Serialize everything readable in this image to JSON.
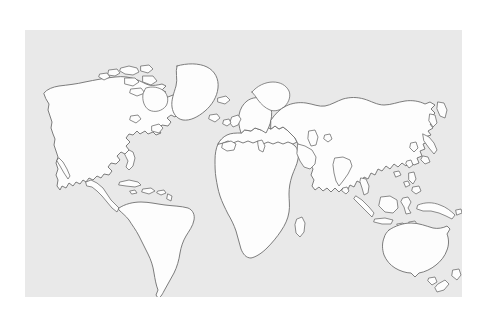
{
  "image": {
    "title": "World Map Outline",
    "kind": "map",
    "projection": "equirectangular-simplified",
    "style": "line-art outline, no labels",
    "caption": ""
  },
  "canvas": {
    "width": 489,
    "height": 314,
    "margin_color": "#ffffff"
  },
  "panel": {
    "left": 25,
    "top": 30,
    "width": 437,
    "height": 267,
    "background_color": "#e9e9e9"
  },
  "palette": {
    "ocean": "#e9e9e9",
    "land_fill": "#fdfdfd",
    "coastline_stroke": "#6e6e6e",
    "page_background": "#ffffff"
  },
  "landmasses": [
    {
      "name": "north-america",
      "label": "North America"
    },
    {
      "name": "greenland",
      "label": "Greenland"
    },
    {
      "name": "central-america",
      "label": "Central America"
    },
    {
      "name": "caribbean-islands",
      "label": "Caribbean Islands"
    },
    {
      "name": "south-america",
      "label": "South America"
    },
    {
      "name": "africa",
      "label": "Africa"
    },
    {
      "name": "europe",
      "label": "Europe"
    },
    {
      "name": "asia",
      "label": "Asia"
    },
    {
      "name": "british-isles",
      "label": "British Isles"
    },
    {
      "name": "scandinavia",
      "label": "Scandinavia"
    },
    {
      "name": "iceland",
      "label": "Iceland"
    },
    {
      "name": "japan",
      "label": "Japan"
    },
    {
      "name": "madagascar",
      "label": "Madagascar"
    },
    {
      "name": "sri-lanka",
      "label": "Sri Lanka"
    },
    {
      "name": "indonesia",
      "label": "Indonesia"
    },
    {
      "name": "philippines",
      "label": "Philippines"
    },
    {
      "name": "new-guinea",
      "label": "New Guinea"
    },
    {
      "name": "australia",
      "label": "Australia"
    },
    {
      "name": "new-zealand",
      "label": "New Zealand"
    },
    {
      "name": "arctic-islands",
      "label": "Canadian Arctic Islands"
    }
  ],
  "legend": {
    "visible": false,
    "entries": []
  },
  "labels": {
    "visible": false,
    "entries": []
  }
}
